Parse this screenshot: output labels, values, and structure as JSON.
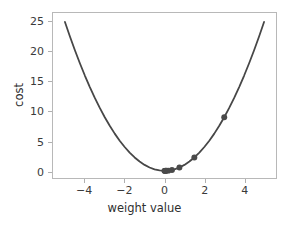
{
  "chart_data": {
    "type": "line",
    "title": "",
    "xlabel": "weight value",
    "ylabel": "cost",
    "xlim": [
      -5.6,
      5.6
    ],
    "ylim": [
      -1.2,
      26.5
    ],
    "xticks": [
      -4,
      -2,
      0,
      2,
      4
    ],
    "xticklabels": [
      "−4",
      "−2",
      "0",
      "2",
      "4"
    ],
    "yticks": [
      0,
      5,
      10,
      15,
      20,
      25
    ],
    "yticklabels": [
      "0",
      "5",
      "10",
      "15",
      "20",
      "25"
    ],
    "grid": false,
    "legend": false,
    "series": [
      {
        "name": "cost curve",
        "type": "line",
        "equation": "y = x^2",
        "color": "#474747",
        "linewidth": 1.8,
        "x": [
          -5.0,
          -4.75,
          -4.5,
          -4.25,
          -4.0,
          -3.75,
          -3.5,
          -3.25,
          -3.0,
          -2.75,
          -2.5,
          -2.25,
          -2.0,
          -1.75,
          -1.5,
          -1.25,
          -1.0,
          -0.75,
          -0.5,
          -0.25,
          0.0,
          0.25,
          0.5,
          0.75,
          1.0,
          1.25,
          1.5,
          1.75,
          2.0,
          2.25,
          2.5,
          2.75,
          3.0,
          3.25,
          3.5,
          3.75,
          4.0,
          4.25,
          4.5,
          4.75,
          5.0
        ],
        "y": [
          25.0,
          22.5625,
          20.25,
          18.0625,
          16.0,
          14.0625,
          12.25,
          10.5625,
          9.0,
          7.5625,
          6.25,
          5.0625,
          4.0,
          3.0625,
          2.25,
          1.5625,
          1.0,
          0.5625,
          0.25,
          0.0625,
          0.0,
          0.0625,
          0.25,
          0.5625,
          1.0,
          1.5625,
          2.25,
          3.0625,
          4.0,
          5.0625,
          6.25,
          7.5625,
          9.0,
          10.5625,
          12.25,
          14.0625,
          16.0,
          18.0625,
          20.25,
          22.5625,
          25.0
        ]
      },
      {
        "name": "gradient descent steps",
        "type": "scatter",
        "color": "#4a4a4a",
        "marker": "o",
        "markersize": 6,
        "x": [
          3.0,
          1.5,
          0.75,
          0.375,
          0.1875,
          0.09375,
          0.046875,
          0.0234375,
          0.01171875,
          0.0
        ],
        "y": [
          9.0,
          2.25,
          0.5625,
          0.140625,
          0.03515625,
          0.0087890625,
          0.002197265625,
          0.00054931640625,
          0.0001373291015625,
          0.0
        ]
      }
    ]
  },
  "axes": {
    "spine_color": "#b8b8b8",
    "tick_color": "#b0b0b0",
    "background": "#ffffff",
    "text_color": "#3a3a3a"
  }
}
